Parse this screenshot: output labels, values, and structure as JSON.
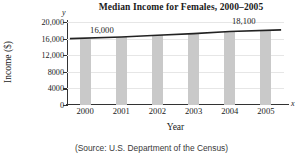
{
  "chart_data": {
    "type": "bar",
    "title": "Median Income for Females, 2000–2005",
    "xlabel": "Year",
    "ylabel": "Income ($)",
    "x_axis_letter": "x",
    "y_axis_letter": "y",
    "categories": [
      "2000",
      "2001",
      "2002",
      "2003",
      "2004",
      "2005"
    ],
    "values": [
      16000,
      16400,
      16800,
      17200,
      17700,
      18100
    ],
    "ylim": [
      0,
      20000
    ],
    "xlim_note": "categorical 2000-2005",
    "yticks": [
      0,
      4000,
      8000,
      12000,
      16000,
      20000
    ],
    "ytick_labels": [
      "0",
      "4000",
      "8000",
      "12,000",
      "16,000",
      "20,000"
    ],
    "grid": true,
    "legend": "none",
    "bar_color": "#c9c9c9",
    "line_color": "#222222",
    "series": [
      {
        "name": "Median income trend line",
        "type": "line",
        "values": [
          16000,
          16400,
          16800,
          17200,
          17700,
          18100
        ]
      }
    ],
    "annotations": [
      {
        "text": "16,000",
        "x": "2000",
        "y": 16000
      },
      {
        "text": "18,100",
        "x": "2005",
        "y": 18100
      }
    ],
    "source": "(Source: U.S. Department of the Census)"
  },
  "labels": {
    "first_value": "16,000",
    "last_value": "18,100"
  }
}
